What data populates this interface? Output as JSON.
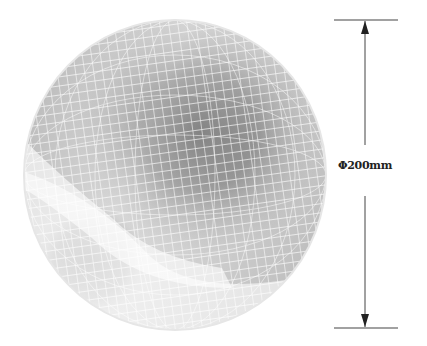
{
  "figure": {
    "object": "mesh-sphere",
    "dimension": {
      "label": "Φ200mm",
      "symbol": "Φ",
      "value": 200,
      "unit": "mm"
    },
    "colors": {
      "background": "#ffffff",
      "mesh_lines": "#ffffff",
      "dark_region": "#3a3a3a",
      "light_region": "#f2f2f2",
      "dimension_line": "#333333"
    }
  }
}
